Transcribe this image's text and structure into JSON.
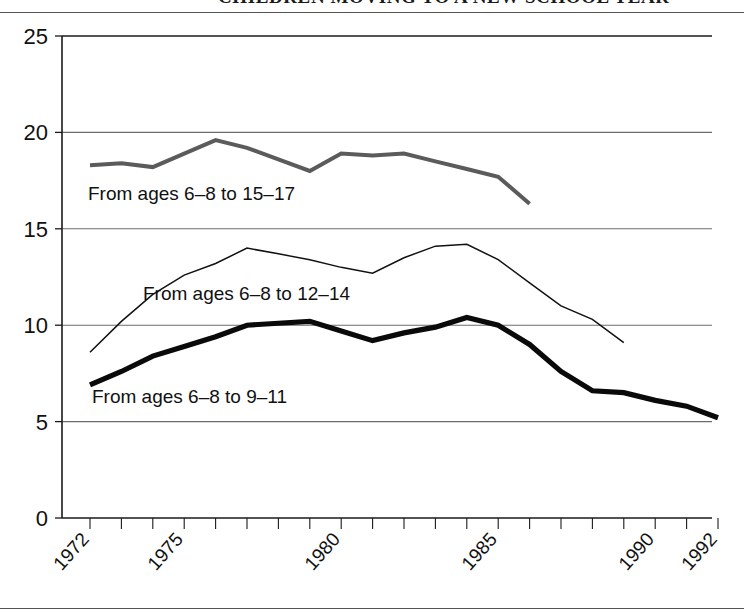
{
  "figure": {
    "title": "CHILDREN MOVING TO A NEW SCHOOL YEAR",
    "rule_color": "#555555"
  },
  "chart_data": {
    "type": "line",
    "title": "",
    "xlabel": "",
    "ylabel": "",
    "ylim": [
      0,
      25
    ],
    "yticks": [
      0,
      5,
      10,
      15,
      20,
      25
    ],
    "ytick_labels": [
      "0",
      "5",
      "10",
      "15",
      "20",
      "25"
    ],
    "grid": true,
    "grid_axis": "y",
    "legend": "inline-labels",
    "xlim": [
      1972,
      1992
    ],
    "x": [
      1972,
      1973,
      1974,
      1975,
      1976,
      1977,
      1978,
      1979,
      1980,
      1981,
      1982,
      1983,
      1984,
      1985,
      1986,
      1987,
      1988,
      1989,
      1990,
      1991,
      1992
    ],
    "xtick_labels": [
      "1972",
      "1975",
      "1980",
      "1985",
      "1990",
      "1992"
    ],
    "xtick_values": [
      1972,
      1975,
      1980,
      1985,
      1990,
      1992
    ],
    "series": [
      {
        "name": "From ages 6-8 to 15-17",
        "label": "From ages 6–8 to 15–17",
        "style": "gray-medium",
        "color": "#5b5b5b",
        "x": [
          1972,
          1973,
          1974,
          1975,
          1976,
          1977,
          1978,
          1979,
          1980,
          1981,
          1982,
          1983,
          1984,
          1985,
          1986
        ],
        "values": [
          18.3,
          18.4,
          18.2,
          18.9,
          19.6,
          19.2,
          18.6,
          18.0,
          18.9,
          18.8,
          18.9,
          18.5,
          18.1,
          17.7,
          16.3
        ]
      },
      {
        "name": "From ages 6-8 to 12-14",
        "label": "From ages 6–8 to 12–14",
        "style": "thin",
        "color": "#111111",
        "x": [
          1972,
          1973,
          1974,
          1975,
          1976,
          1977,
          1978,
          1979,
          1980,
          1981,
          1982,
          1983,
          1984,
          1985,
          1986,
          1987,
          1988,
          1989
        ],
        "values": [
          8.6,
          10.2,
          11.6,
          12.6,
          13.2,
          14.0,
          13.7,
          13.4,
          13.0,
          12.7,
          13.5,
          14.1,
          14.2,
          13.4,
          12.2,
          11.0,
          10.3,
          9.1
        ]
      },
      {
        "name": "From ages 6-8 to 9-11",
        "label": "From ages 6–8 to 9–11",
        "style": "thick",
        "color": "#0a0a0a",
        "x": [
          1972,
          1973,
          1974,
          1975,
          1976,
          1977,
          1978,
          1979,
          1980,
          1981,
          1982,
          1983,
          1984,
          1985,
          1986,
          1987,
          1988,
          1989,
          1990,
          1991,
          1992
        ],
        "values": [
          6.9,
          7.6,
          8.4,
          8.9,
          9.4,
          10.0,
          10.1,
          10.2,
          9.7,
          9.2,
          9.6,
          9.9,
          10.4,
          10.0,
          9.0,
          7.6,
          6.6,
          6.5,
          6.1,
          5.8,
          5.2
        ]
      }
    ],
    "series_label_positions": [
      {
        "x": 88,
        "y": 200
      },
      {
        "x": 143,
        "y": 300
      },
      {
        "x": 92,
        "y": 403
      }
    ]
  },
  "geometry": {
    "plot_left": 62,
    "plot_right": 712,
    "plot_top": 36,
    "plot_bottom": 518,
    "x_first_tick": 90,
    "x_tick_step": 31.4
  }
}
